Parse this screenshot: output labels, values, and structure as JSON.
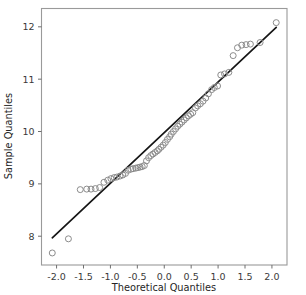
{
  "figure": {
    "background": "#ffffff",
    "frame_color": "#9a9a9a",
    "tick_color": "#6e6e6e",
    "label_color": "#3a3a3a"
  },
  "chart_data": {
    "type": "scatter",
    "title": "",
    "subtitle": "",
    "xlabel": "Theoretical Quantiles",
    "ylabel": "Sample Quantiles",
    "xlim": [
      -2.28,
      2.28
    ],
    "ylim": [
      7.45,
      12.35
    ],
    "xticks": [
      -2.0,
      -1.5,
      -1.0,
      -0.5,
      0.0,
      0.5,
      1.0,
      1.5,
      2.0
    ],
    "xticklabels": [
      "-2.0",
      "-1.5",
      "-1.0",
      "-0.5",
      "0.0",
      "0.5",
      "1.0",
      "1.5",
      "2.0"
    ],
    "yticks": [
      8,
      9,
      10,
      11,
      12
    ],
    "yticklabels": [
      "8",
      "9",
      "10",
      "11",
      "12"
    ],
    "grid": false,
    "legend": null,
    "marker": {
      "style": "open-circle",
      "edge_color": "#8c8c8c",
      "face_color": "none",
      "radius": 3.0,
      "line_width": 1.0
    },
    "reference_line": {
      "name": "qq-reference-line",
      "color": "#151515",
      "width": 1.7,
      "x": [
        -2.08,
        2.08
      ],
      "y": [
        7.97,
        11.99
      ]
    },
    "series": [
      {
        "name": "Sample Quantiles",
        "points": [
          [
            -2.08,
            7.68
          ],
          [
            -1.78,
            7.95
          ],
          [
            -1.56,
            8.89
          ],
          [
            -1.44,
            8.9
          ],
          [
            -1.36,
            8.9
          ],
          [
            -1.28,
            8.91
          ],
          [
            -1.2,
            8.93
          ],
          [
            -1.12,
            9.03
          ],
          [
            -1.05,
            9.07
          ],
          [
            -0.99,
            9.1
          ],
          [
            -0.93,
            9.12
          ],
          [
            -0.88,
            9.13
          ],
          [
            -0.82,
            9.15
          ],
          [
            -0.77,
            9.17
          ],
          [
            -0.72,
            9.2
          ],
          [
            -0.67,
            9.26
          ],
          [
            -0.62,
            9.28
          ],
          [
            -0.58,
            9.29
          ],
          [
            -0.53,
            9.3
          ],
          [
            -0.49,
            9.31
          ],
          [
            -0.45,
            9.32
          ],
          [
            -0.41,
            9.33
          ],
          [
            -0.37,
            9.35
          ],
          [
            -0.33,
            9.44
          ],
          [
            -0.29,
            9.5
          ],
          [
            -0.25,
            9.54
          ],
          [
            -0.21,
            9.57
          ],
          [
            -0.17,
            9.6
          ],
          [
            -0.13,
            9.63
          ],
          [
            -0.1,
            9.66
          ],
          [
            -0.06,
            9.7
          ],
          [
            -0.02,
            9.74
          ],
          [
            0.02,
            9.79
          ],
          [
            0.06,
            9.85
          ],
          [
            0.1,
            9.9
          ],
          [
            0.13,
            9.95
          ],
          [
            0.17,
            10.0
          ],
          [
            0.21,
            10.05
          ],
          [
            0.25,
            10.1
          ],
          [
            0.29,
            10.14
          ],
          [
            0.33,
            10.18
          ],
          [
            0.37,
            10.22
          ],
          [
            0.41,
            10.26
          ],
          [
            0.45,
            10.3
          ],
          [
            0.49,
            10.33
          ],
          [
            0.53,
            10.36
          ],
          [
            0.58,
            10.45
          ],
          [
            0.62,
            10.49
          ],
          [
            0.67,
            10.53
          ],
          [
            0.72,
            10.58
          ],
          [
            0.77,
            10.64
          ],
          [
            0.82,
            10.72
          ],
          [
            0.88,
            10.8
          ],
          [
            0.93,
            10.84
          ],
          [
            0.99,
            10.87
          ],
          [
            1.05,
            11.08
          ],
          [
            1.12,
            11.1
          ],
          [
            1.2,
            11.13
          ],
          [
            1.28,
            11.45
          ],
          [
            1.36,
            11.6
          ],
          [
            1.44,
            11.65
          ],
          [
            1.52,
            11.66
          ],
          [
            1.6,
            11.67
          ],
          [
            1.78,
            11.7
          ],
          [
            2.08,
            12.08
          ]
        ]
      }
    ]
  }
}
